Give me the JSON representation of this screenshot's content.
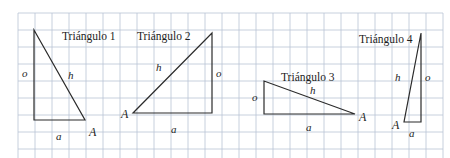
{
  "figure": {
    "kind": "geometry-diagram",
    "background_color": "#ffffff",
    "grid": {
      "line_color": "#b9c4d4",
      "spacing_px": 17,
      "origin_x": 18,
      "origin_y": 13,
      "cols": 25,
      "rows": 9,
      "visible": true
    },
    "stroke_color": "#2b2b2b",
    "triangles": [
      {
        "id": "triangulo-1",
        "title": "Triángulo 1",
        "title_x": 62,
        "title_y": 31,
        "vertices": {
          "apex": [
            34,
            30
          ],
          "right_angle": [
            34,
            120
          ],
          "A": [
            85,
            120
          ]
        },
        "labels": {
          "opposite": {
            "text": "o",
            "x": 22,
            "y": 68
          },
          "hypotenuse": {
            "text": "h",
            "x": 68,
            "y": 70
          },
          "adjacent": {
            "text": "a",
            "x": 56,
            "y": 131
          },
          "vertex": {
            "text": "A",
            "x": 89,
            "y": 126
          }
        }
      },
      {
        "id": "triangulo-2",
        "title": "Triángulo 2",
        "title_x": 137,
        "title_y": 31,
        "vertices": {
          "A": [
            133,
            113
          ],
          "right_angle": [
            212,
            113
          ],
          "apex": [
            212,
            33
          ]
        },
        "labels": {
          "opposite": {
            "text": "o",
            "x": 216,
            "y": 68
          },
          "hypotenuse": {
            "text": "h",
            "x": 156,
            "y": 62
          },
          "adjacent": {
            "text": "a",
            "x": 171,
            "y": 124
          },
          "vertex": {
            "text": "A",
            "x": 121,
            "y": 108
          }
        }
      },
      {
        "id": "triangulo-3",
        "title": "Triángulo 3",
        "title_x": 281,
        "title_y": 72,
        "vertices": {
          "apex": [
            264,
            81
          ],
          "right_angle": [
            264,
            114
          ],
          "A": [
            355,
            114
          ]
        },
        "labels": {
          "opposite": {
            "text": "o",
            "x": 252,
            "y": 92
          },
          "hypotenuse": {
            "text": "h",
            "x": 310,
            "y": 85
          },
          "adjacent": {
            "text": "a",
            "x": 306,
            "y": 122
          },
          "vertex": {
            "text": "A",
            "x": 359,
            "y": 111
          }
        }
      },
      {
        "id": "triangulo-4",
        "title": "Triángulo 4",
        "title_x": 359,
        "title_y": 34,
        "vertices": {
          "apex": [
            421,
            33
          ],
          "right_angle": [
            421,
            122
          ],
          "A": [
            404,
            122
          ]
        },
        "labels": {
          "opposite": {
            "text": "o",
            "x": 425,
            "y": 72
          },
          "hypotenuse": {
            "text": "h",
            "x": 395,
            "y": 72
          },
          "adjacent": {
            "text": "a",
            "x": 409,
            "y": 128
          },
          "vertex": {
            "text": "A",
            "x": 392,
            "y": 119
          }
        }
      }
    ]
  }
}
